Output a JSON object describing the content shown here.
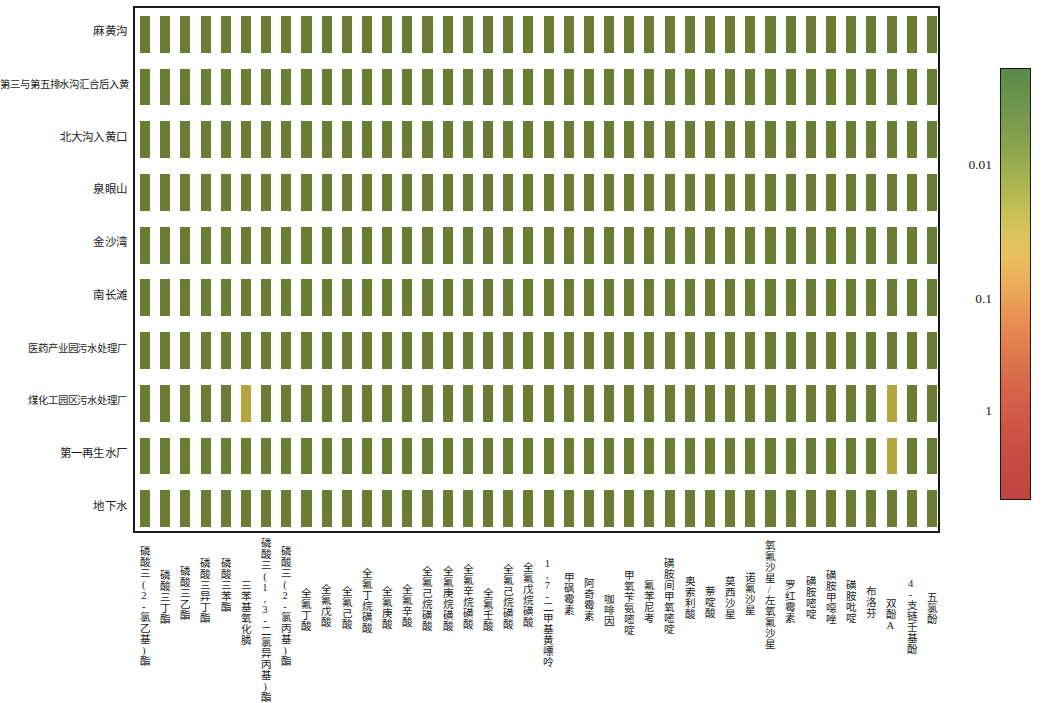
{
  "figure": {
    "type": "heatmap",
    "background": "#ffffff",
    "plot_border_color": "#1a1a1a"
  },
  "rows": [
    {
      "label": "麻黄沟"
    },
    {
      "label": "第三与第五排水沟汇合后入黄"
    },
    {
      "label": "北大沟入黄口"
    },
    {
      "label": "泉眼山"
    },
    {
      "label": "金沙湾"
    },
    {
      "label": "南长滩"
    },
    {
      "label": "医药产业园污水处理厂"
    },
    {
      "label": "煤化工园区污水处理厂"
    },
    {
      "label": "第一再生水厂"
    },
    {
      "label": "地下水"
    }
  ],
  "columns": [
    {
      "label": "磷酸三(2-氯乙基)酯"
    },
    {
      "label": "磷酸三丁酯"
    },
    {
      "label": "磷酸三乙酯"
    },
    {
      "label": "磷酸三异丁酯"
    },
    {
      "label": "磷酸三苯酯"
    },
    {
      "label": "三苯基氧化膦"
    },
    {
      "label": "磷酸三(1,3-二氯异丙基)酯"
    },
    {
      "label": "磷酸三(2-氯丙基)酯"
    },
    {
      "label": "全氟丁酸"
    },
    {
      "label": "全氟戊酸"
    },
    {
      "label": "全氟己酸"
    },
    {
      "label": "全氟丁烷磺酸"
    },
    {
      "label": "全氟庚酸"
    },
    {
      "label": "全氟辛酸"
    },
    {
      "label": "全氟己烷磺酸"
    },
    {
      "label": "全氟庚烷磺酸"
    },
    {
      "label": "全氟辛烷磺酸"
    },
    {
      "label": "全氟壬酸"
    },
    {
      "label": "全氟己烷磺酸"
    },
    {
      "label": "全氟戊烷磺酸"
    },
    {
      "label": "1,7-二甲基黄嘌呤"
    },
    {
      "label": "甲砜霉素"
    },
    {
      "label": "阿奇霉素"
    },
    {
      "label": "咖啡因"
    },
    {
      "label": "甲氧苄氨嘧啶"
    },
    {
      "label": "氟苯尼考"
    },
    {
      "label": "磺胺间甲氧嘧啶"
    },
    {
      "label": "奥索利酸"
    },
    {
      "label": "萘啶酸"
    },
    {
      "label": "莫西沙星"
    },
    {
      "label": "诺氟沙星"
    },
    {
      "label": "氧氟沙星/左氧氟沙星"
    },
    {
      "label": "罗红霉素"
    },
    {
      "label": "磺胺嘧啶"
    },
    {
      "label": "磺胺甲噁唑"
    },
    {
      "label": "磺胺吡啶"
    },
    {
      "label": "布洛芬"
    },
    {
      "label": "双酚A"
    },
    {
      "label": "4-支链壬基酚"
    },
    {
      "label": "五氯酚"
    }
  ],
  "colorbar": {
    "orientation": "vertical",
    "scale": "log",
    "ticks": [
      {
        "value": "0.01",
        "position_pct": 22.5
      },
      {
        "value": "0.1",
        "position_pct": 53.5
      },
      {
        "value": "1",
        "position_pct": 79.5
      }
    ],
    "high_color": "#5b8a4a",
    "mid_color": "#e9bf5c",
    "low_color": "#bf4440"
  },
  "chart_data": {
    "type": "heatmap",
    "title": "",
    "xlabel": "",
    "ylabel": "",
    "grid": false,
    "legend_position": "right",
    "colorscale": [
      "#5b8a4a",
      "#a8b451",
      "#ddc45c",
      "#e9bf5c",
      "#eda95a",
      "#d6664a",
      "#bf4440"
    ],
    "value_scale": "log",
    "colorbar_ticks": [
      0.01,
      0.1,
      1
    ],
    "note": "Nearly all cells share the uniform dark olive-green baseline color (high/low-concentration baseline). Three cells are noticeably lighter yellow-olive.",
    "baseline_color": "#6b7d33",
    "baseline_value": 0.004,
    "x": [
      "磷酸三(2-氯乙基)酯",
      "磷酸三丁酯",
      "磷酸三乙酯",
      "磷酸三异丁酯",
      "磷酸三苯酯",
      "三苯基氧化膦",
      "磷酸三(1,3-二氯异丙基)酯",
      "磷酸三(2-氯丙基)酯",
      "全氟丁酸",
      "全氟戊酸",
      "全氟己酸",
      "全氟丁烷磺酸",
      "全氟庚酸",
      "全氟辛酸",
      "全氟己烷磺酸",
      "全氟庚烷磺酸",
      "全氟辛烷磺酸",
      "全氟壬酸",
      "全氟己烷磺酸",
      "全氟戊烷磺酸",
      "1,7-二甲基黄嘌呤",
      "甲砜霉素",
      "阿奇霉素",
      "咖啡因",
      "甲氧苄氨嘧啶",
      "氟苯尼考",
      "磺胺间甲氧嘧啶",
      "奥索利酸",
      "萘啶酸",
      "莫西沙星",
      "诺氟沙星",
      "氧氟沙星/左氧氟沙星",
      "罗红霉素",
      "磺胺嘧啶",
      "磺胺甲噁唑",
      "磺胺吡啶",
      "布洛芬",
      "双酚A",
      "4-支链壬基酚",
      "五氯酚"
    ],
    "y": [
      "麻黄沟",
      "第三与第五排水沟汇合后入黄",
      "北大沟入黄口",
      "泉眼山",
      "金沙湾",
      "南长滩",
      "医药产业园污水处理厂",
      "煤化工园区污水处理厂",
      "第一再生水厂",
      "地下水"
    ],
    "highlighted_cells": [
      {
        "row": 7,
        "col": 5,
        "color": "#b5a53e",
        "value": 0.012
      },
      {
        "row": 7,
        "col": 37,
        "color": "#b5a53e",
        "value": 0.012
      },
      {
        "row": 8,
        "col": 37,
        "color": "#b5a53e",
        "value": 0.012
      }
    ]
  }
}
